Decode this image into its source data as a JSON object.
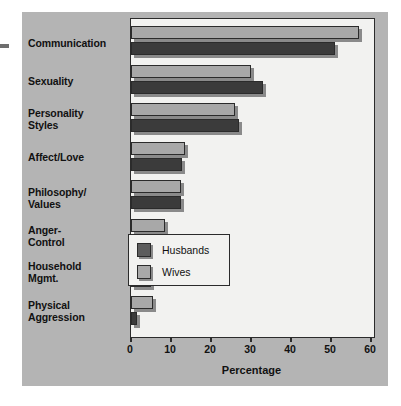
{
  "chart_data": {
    "type": "bar",
    "orientation": "horizontal",
    "title": "",
    "xlabel": "Percentage",
    "ylabel": "",
    "xlim": [
      0,
      60
    ],
    "xticks": [
      0,
      10,
      20,
      30,
      40,
      50,
      60
    ],
    "xtick_labels": [
      "0",
      "10",
      "20",
      "30",
      "40",
      "50",
      "60"
    ],
    "grid": false,
    "legend_position": "center-right-inside",
    "categories": [
      "Communication",
      "Sexuality",
      "Personality Styles",
      "Affect/Love",
      "Philosophy/ Values",
      "Anger- Control",
      "Household Mgmt.",
      "Physical Aggression"
    ],
    "series": [
      {
        "name": "Husbands",
        "color": "#3b3b3b",
        "values": [
          51,
          33,
          27,
          12.7,
          12.5,
          10,
          5,
          1.5
        ]
      },
      {
        "name": "Wives",
        "color": "#a8a8a8",
        "values": [
          57,
          30,
          26,
          13.5,
          12.5,
          8.5,
          3.5,
          5.5
        ]
      }
    ]
  },
  "labels": {
    "categories_display": [
      [
        "Communication"
      ],
      [
        "Sexuality"
      ],
      [
        "Personality",
        "Styles"
      ],
      [
        "Affect/Love"
      ],
      [
        "Philosophy/",
        "Values"
      ],
      [
        "Anger-",
        "Control"
      ],
      [
        "Household",
        "Mgmt."
      ],
      [
        "Physical",
        "Aggression"
      ]
    ]
  },
  "legend": {
    "items": [
      {
        "label": "Husbands",
        "swatch": "#5d5d5d"
      },
      {
        "label": "Wives",
        "swatch": "#a8a8a8"
      }
    ]
  },
  "axis": {
    "title": "Percentage"
  },
  "colors": {
    "panel_background": "#b4b4b4",
    "plot_background": "#f2f2f0",
    "axis_line": "#2b2b2b",
    "husbands": "#3b3b3b",
    "wives": "#a8a8a8",
    "shadow": "#8a8a8a",
    "text": "#111111"
  }
}
